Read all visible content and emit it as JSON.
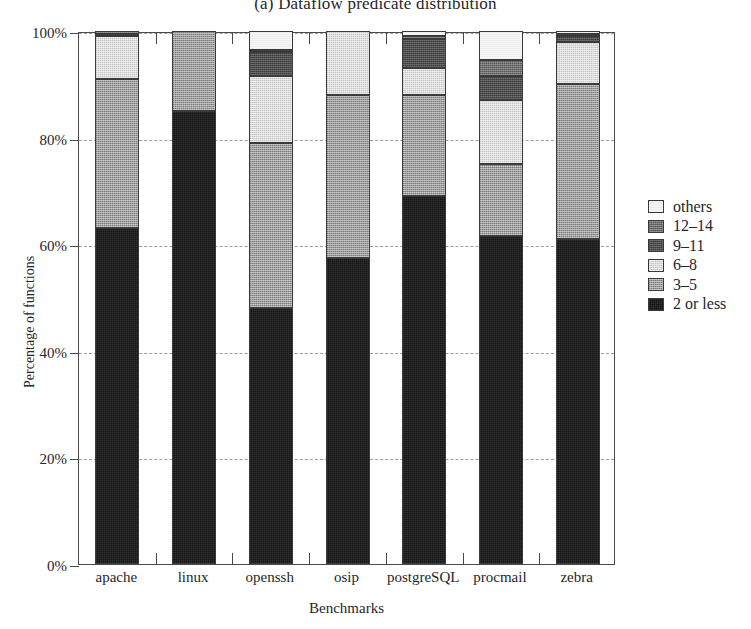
{
  "figure": {
    "title": "(a) Dataflow predicate distribution"
  },
  "axes": {
    "ylabel": "Percentage of functions",
    "xlabel": "Benchmarks",
    "yticks": [
      "0%",
      "20%",
      "40%",
      "60%",
      "80%",
      "100%"
    ]
  },
  "legend": {
    "entries": [
      {
        "label": "others",
        "class": "f-others"
      },
      {
        "label": "12–14",
        "class": "f-12to14"
      },
      {
        "label": "9–11",
        "class": "f-9to11"
      },
      {
        "label": "6–8",
        "class": "f-6to8"
      },
      {
        "label": "3–5",
        "class": "f-3to5"
      },
      {
        "label": "2 or less",
        "class": "f-2less"
      }
    ]
  },
  "chart_data": {
    "type": "bar",
    "subtype": "stacked-percentage",
    "title": "(a) Dataflow predicate distribution",
    "xlabel": "Benchmarks",
    "ylabel": "Percentage of functions",
    "ylim": [
      0,
      100
    ],
    "yticks": [
      0,
      20,
      40,
      60,
      80,
      100
    ],
    "ytick_labels": [
      "0%",
      "20%",
      "40%",
      "60%",
      "80%",
      "100%"
    ],
    "grid": "horizontal-dashed",
    "legend_position": "right",
    "categories": [
      "apache",
      "linux",
      "openssh",
      "osip",
      "postgreSQL",
      "procmail",
      "zebra"
    ],
    "series": [
      {
        "name": "2 or less",
        "fill": "f-2less",
        "values": [
          63.0,
          85.0,
          48.0,
          57.5,
          69.0,
          61.5,
          61.0
        ]
      },
      {
        "name": "3–5",
        "fill": "f-3to5",
        "values": [
          28.0,
          15.0,
          31.0,
          30.5,
          19.0,
          13.5,
          29.0
        ]
      },
      {
        "name": "6–8",
        "fill": "f-6to8",
        "values": [
          8.0,
          0.0,
          12.5,
          12.0,
          5.0,
          12.0,
          8.0
        ]
      },
      {
        "name": "9–11",
        "fill": "f-9to11",
        "values": [
          0.5,
          0.0,
          4.5,
          0.0,
          5.5,
          4.5,
          1.0
        ]
      },
      {
        "name": "12–14",
        "fill": "f-12to14",
        "values": [
          0.5,
          0.0,
          0.5,
          0.0,
          0.5,
          3.0,
          0.5
        ]
      },
      {
        "name": "others",
        "fill": "f-others",
        "values": [
          0.0,
          0.0,
          3.5,
          0.0,
          1.0,
          5.5,
          0.5
        ]
      }
    ]
  }
}
